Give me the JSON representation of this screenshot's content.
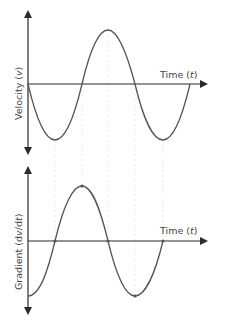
{
  "top_graph": {
    "y_label_main": "Velocity (",
    "y_label_var": "v",
    "y_label_end": ")",
    "x_label_main": "Time (",
    "x_label_var": "t",
    "x_label_end": ")"
  },
  "bottom_graph": {
    "y_label_main": "Gradient (d",
    "y_label_var": "v",
    "y_label_mid": "/d",
    "y_label_var2": "t",
    "y_label_end": ")",
    "x_label_main": "Time (",
    "x_label_var": "t",
    "x_label_end": ")"
  },
  "colors": {
    "axis": "#2b2b2b",
    "curve": "#555555",
    "guide": "#d8d8d8"
  }
}
